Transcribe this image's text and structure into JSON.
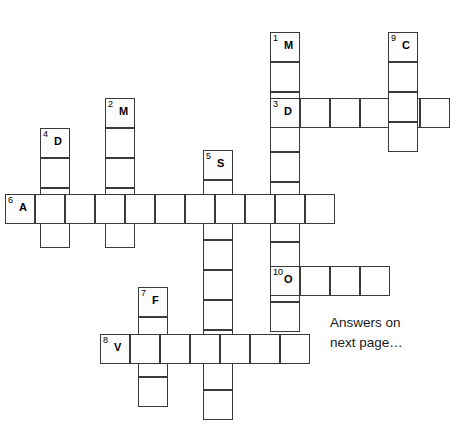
{
  "puzzle": {
    "kind": "crossword-grid",
    "cell_size": 30,
    "grid_line_color": "#3a3a3a",
    "background_color": "#ffffff",
    "entries": [
      {
        "number": "1",
        "letter": "M",
        "direction": "down",
        "x": 270,
        "y": 32,
        "length": 10
      },
      {
        "number": "2",
        "letter": "M",
        "direction": "down",
        "x": 105,
        "y": 98,
        "length": 5
      },
      {
        "number": "3",
        "letter": "D",
        "direction": "across",
        "x": 270,
        "y": 98,
        "length": 6
      },
      {
        "number": "4",
        "letter": "D",
        "direction": "down",
        "x": 40,
        "y": 128,
        "length": 4
      },
      {
        "number": "5",
        "letter": "S",
        "direction": "down",
        "x": 203,
        "y": 150,
        "length": 9
      },
      {
        "number": "6",
        "letter": "A",
        "direction": "across",
        "x": 5,
        "y": 194,
        "length": 11
      },
      {
        "number": "7",
        "letter": "F",
        "direction": "down",
        "x": 138,
        "y": 287,
        "length": 4
      },
      {
        "number": "8",
        "letter": "V",
        "direction": "across",
        "x": 100,
        "y": 334,
        "length": 7
      },
      {
        "number": "9",
        "letter": "C",
        "direction": "down",
        "x": 388,
        "y": 32,
        "length": 4
      },
      {
        "number": "10",
        "letter": "O",
        "direction": "across",
        "x": 270,
        "y": 266,
        "length": 4
      }
    ]
  },
  "notes": {
    "answers_text": "Answers on\nnext page…"
  }
}
